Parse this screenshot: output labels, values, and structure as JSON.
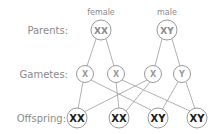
{
  "rows": {
    "parents": "Parents:",
    "gametes": "Gametes:",
    "offspring": "Offspring:"
  },
  "parents": [
    {
      "sex": "female",
      "genotype": "XX"
    },
    {
      "sex": "male",
      "genotype": "XY"
    }
  ],
  "gametes": [
    {
      "allele": "X",
      "from": "female"
    },
    {
      "allele": "X",
      "from": "female"
    },
    {
      "allele": "X",
      "from": "male"
    },
    {
      "allele": "Y",
      "from": "male"
    }
  ],
  "offspring": [
    {
      "genotype": "XX"
    },
    {
      "genotype": "XX"
    },
    {
      "genotype": "XY"
    },
    {
      "genotype": "XY"
    }
  ],
  "colors": {
    "line": "#a8a8a8",
    "label": "#8a8a8a",
    "offspring_text": "#1a1a1a"
  }
}
